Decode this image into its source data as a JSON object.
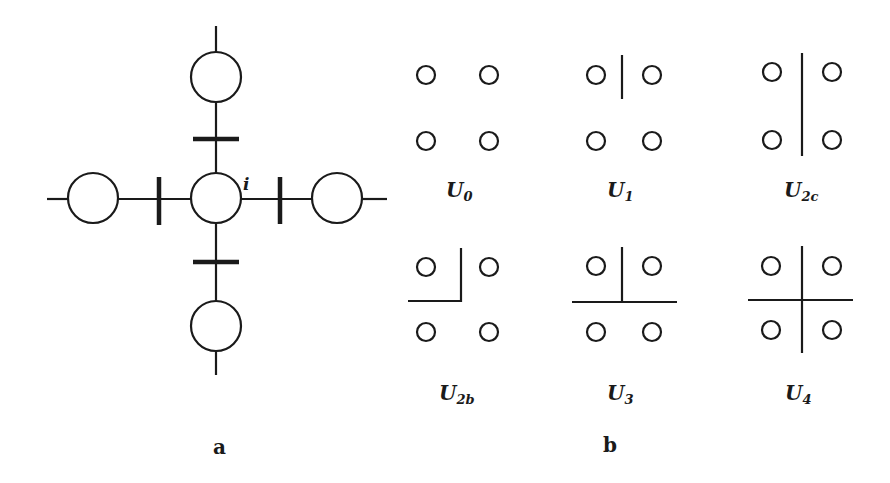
{
  "panel_a": {
    "label": "a",
    "center_node_label": "i",
    "nodes": [
      {
        "id": "center",
        "cx": 216,
        "cy": 198,
        "r": 25
      },
      {
        "id": "top",
        "cx": 216,
        "cy": 77,
        "r": 25
      },
      {
        "id": "bottom",
        "cx": 216,
        "cy": 326,
        "r": 25
      },
      {
        "id": "left",
        "cx": 93,
        "cy": 198,
        "r": 25
      },
      {
        "id": "right",
        "cx": 337,
        "cy": 198,
        "r": 25
      }
    ],
    "bond_marks": [
      "top",
      "bottom",
      "left",
      "right"
    ]
  },
  "panel_b": {
    "label": "b",
    "configurations": [
      {
        "name": "U",
        "sub": "0",
        "row": 0,
        "col": 0
      },
      {
        "name": "U",
        "sub": "1",
        "row": 0,
        "col": 1
      },
      {
        "name": "U",
        "sub": "2c",
        "row": 0,
        "col": 2
      },
      {
        "name": "U",
        "sub": "2b",
        "row": 1,
        "col": 0
      },
      {
        "name": "U",
        "sub": "3",
        "row": 1,
        "col": 1
      },
      {
        "name": "U",
        "sub": "4",
        "row": 1,
        "col": 2
      }
    ]
  },
  "colors": {
    "stroke": "#1a1a1a",
    "background": "#ffffff"
  }
}
